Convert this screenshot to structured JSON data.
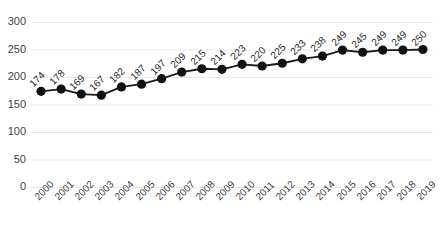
{
  "chart_data": {
    "type": "line",
    "title": "",
    "xlabel": "",
    "ylabel": "",
    "categories": [
      "2000",
      "2001",
      "2002",
      "2003",
      "2004",
      "2005",
      "2006",
      "2007",
      "2008",
      "2009",
      "2010",
      "2011",
      "2012",
      "2013",
      "2014",
      "2015",
      "2016",
      "2017",
      "2018",
      "2019"
    ],
    "values": [
      174,
      178,
      169,
      167,
      182,
      187,
      197,
      209,
      215,
      214,
      223,
      220,
      225,
      233,
      238,
      249,
      245,
      249,
      249,
      250
    ],
    "data_labels": [
      "174",
      "178",
      "169",
      "167",
      "182",
      "187",
      "197",
      "209",
      "215",
      "214",
      "223",
      "220",
      "225",
      "233",
      "238",
      "249",
      "245",
      "249",
      "249",
      "250"
    ],
    "ylim": [
      0,
      300
    ],
    "yticks": [
      0,
      50,
      100,
      150,
      200,
      250,
      300
    ],
    "ytick_labels": [
      "0",
      "50",
      "100",
      "150",
      "200",
      "250",
      "300"
    ],
    "grid": true,
    "grid_axis": "y",
    "legend": false,
    "legend_position": "none",
    "series_color": "#1a1a1a",
    "marker": "circle",
    "marker_color": "#111111",
    "grid_color": "#e8e8e8",
    "label_color": "#3f3f3f"
  }
}
